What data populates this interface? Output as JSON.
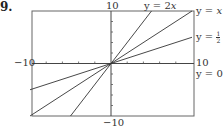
{
  "problem_number": "9.",
  "chart_data": {
    "type": "line",
    "title": "",
    "xlabel": "",
    "ylabel": "",
    "xlim": [
      -10,
      10
    ],
    "ylim": [
      -10,
      10
    ],
    "grid": false,
    "x_tick_step": 2,
    "y_tick_step": 2,
    "axis_labels": {
      "x_min": "-10",
      "x_max": "10",
      "y_min": "-10",
      "y_max": "10"
    },
    "series": [
      {
        "name": "y = 2x",
        "slope": 2,
        "points": [
          [
            -5,
            -10
          ],
          [
            5,
            10
          ]
        ]
      },
      {
        "name": "y = x",
        "slope": 1,
        "points": [
          [
            -10,
            -10
          ],
          [
            10,
            10
          ]
        ]
      },
      {
        "name": "y = 1/2 x",
        "slope": 0.5,
        "points": [
          [
            -10,
            -5
          ],
          [
            10,
            5
          ]
        ]
      },
      {
        "name": "y = 0",
        "slope": 0,
        "points": [
          [
            -10,
            0
          ],
          [
            10,
            0
          ]
        ]
      }
    ],
    "legend": "inline labels at right/top edges"
  },
  "labels": {
    "x_min": "−10",
    "x_max": "10",
    "y_max": "10",
    "y_min": "−10",
    "y2x_prefix": "y = 2",
    "y2x_var": "x",
    "yx_prefix": "y = ",
    "yx_var": "x",
    "yhalf_prefix": "y = ",
    "yhalf_num": "1",
    "yhalf_den": "2",
    "yhalf_var": "x",
    "y0": "y = 0"
  },
  "colors": {
    "frame": "#666666",
    "line": "#333333",
    "text": "#333333"
  }
}
